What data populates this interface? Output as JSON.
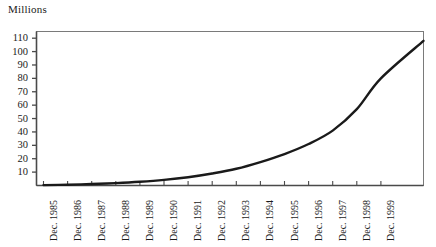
{
  "chart_data": {
    "type": "line",
    "title": "Millions",
    "xlabel": "",
    "ylabel": "Millions",
    "ylim": [
      0,
      115
    ],
    "yticks": [
      10,
      20,
      30,
      40,
      50,
      60,
      70,
      80,
      90,
      100,
      110
    ],
    "grid": false,
    "legend": false,
    "legend_position": "none",
    "line_color": "#1a1a1a",
    "axis_color": "#7a7a7a",
    "background_color": "#ffffff",
    "categories": [
      "Dec. 1985",
      "Dec. 1986",
      "Dec. 1987",
      "Dec. 1988",
      "Dec. 1989",
      "Dec. 1990",
      "Dec. 1991",
      "Dec. 1992",
      "Dec. 1993",
      "Dec. 1994",
      "Dec. 1995",
      "Dec. 1996",
      "Dec. 1997",
      "Dec. 1998",
      "Dec. 1999"
    ],
    "values": [
      0.3,
      0.6,
      1.1,
      1.8,
      2.8,
      4.2,
      6.2,
      9.0,
      12.5,
      17.5,
      23.5,
      31.0,
      41.0,
      57.0,
      80.0
    ],
    "end_value": 108
  },
  "axis_titles": {
    "y": "Millions"
  }
}
